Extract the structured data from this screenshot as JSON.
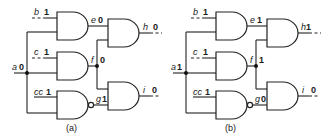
{
  "figure": {
    "panels": [
      {
        "caption": "(a)",
        "signals": {
          "b": {
            "name": "b",
            "value": "1"
          },
          "c": {
            "name": "c",
            "value": "1"
          },
          "cc": {
            "name": "cc",
            "value": "1"
          },
          "a": {
            "name": "a",
            "value": "0"
          },
          "e": {
            "name": "e",
            "value": "0"
          },
          "f": {
            "name": "f",
            "value": "0"
          },
          "g": {
            "name": "g",
            "value": "1"
          },
          "h": {
            "name": "h",
            "value": "0"
          },
          "i": {
            "name": "i",
            "value": "0"
          }
        }
      },
      {
        "caption": "(b)",
        "signals": {
          "b": {
            "name": "b",
            "value": "1"
          },
          "c": {
            "name": "c",
            "value": "1"
          },
          "cc": {
            "name": "cc",
            "value": "1"
          },
          "a": {
            "name": "a",
            "value": "1"
          },
          "e": {
            "name": "e",
            "value": "1"
          },
          "f": {
            "name": "f",
            "value": "1"
          },
          "g": {
            "name": "g",
            "value": "0"
          },
          "h": {
            "name": "h",
            "value": "1"
          },
          "i": {
            "name": "i",
            "value": "0"
          }
        }
      }
    ],
    "gates": [
      {
        "id": "gate-e",
        "type": "AND",
        "inputs": [
          "b",
          "a"
        ],
        "output": "e"
      },
      {
        "id": "gate-f",
        "type": "AND",
        "inputs": [
          "c",
          "a"
        ],
        "output": "f"
      },
      {
        "id": "gate-g",
        "type": "NAND",
        "inputs": [
          "cc",
          "a"
        ],
        "output": "g"
      },
      {
        "id": "gate-h",
        "type": "AND",
        "inputs": [
          "e",
          "f"
        ],
        "output": "h"
      },
      {
        "id": "gate-i",
        "type": "AND",
        "inputs": [
          "f",
          "g"
        ],
        "output": "i"
      }
    ]
  }
}
